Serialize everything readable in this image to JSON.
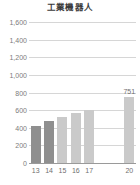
{
  "chart_data": {
    "type": "bar",
    "title": "工業機器人",
    "xlabel": "",
    "ylabel": "",
    "categories": [
      "13",
      "14",
      "15",
      "16",
      "17",
      "20"
    ],
    "values": [
      420,
      475,
      525,
      565,
      600,
      751
    ],
    "point_labels": [
      "",
      "",
      "",
      "",
      "",
      "751"
    ],
    "ylim": [
      0,
      1600
    ],
    "ytick_values": [
      0,
      200,
      400,
      600,
      800,
      1000,
      1200,
      1400,
      1600
    ],
    "ytick_labels": [
      "0",
      "200",
      "400",
      "600",
      "800",
      "1,000",
      "1,200",
      "1,400",
      "1,600"
    ],
    "grid": true,
    "legend": null,
    "bar_colors": [
      "#8f8f8f",
      "#8f8f8f",
      "#cacaca",
      "#cacaca",
      "#cacaca",
      "#cacaca"
    ],
    "series": [
      {
        "name": "工業機器人",
        "values": [
          420,
          475,
          525,
          565,
          600,
          751
        ]
      }
    ]
  },
  "colors": {
    "bar_dark": "#8f8f8f",
    "bar_light": "#cacaca",
    "gridline": "#d6d6d6",
    "axis": "#9a9a9a",
    "tick_text": "#6f6f6f",
    "ylabel_text": "#7c7c7c",
    "title_text": "#3a3a3a",
    "background": "#ffffff"
  }
}
